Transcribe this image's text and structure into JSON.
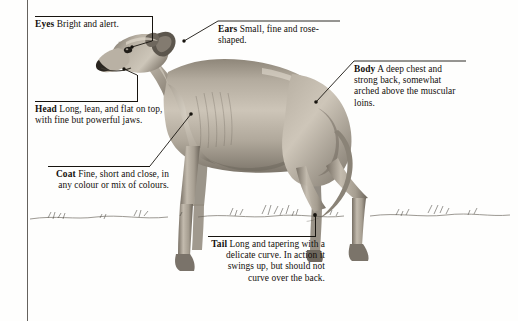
{
  "figure": {
    "ground_line": "sketched grass horizon",
    "colors": {
      "ink": "#17140f",
      "paper": "#fefefd",
      "coat_light": "#cfc7ba",
      "coat_mid": "#a39a8d",
      "coat_dark": "#6d665c",
      "coat_shadow": "#4a443c"
    }
  },
  "callouts": [
    {
      "id": "eyes",
      "term": "Eyes",
      "text": " Bright and alert."
    },
    {
      "id": "head",
      "term": "Head",
      "text": " Long, lean, and flat on top, with fine but powerful jaws."
    },
    {
      "id": "coat",
      "term": "Coat",
      "text": " Fine, short and close, in any colour or mix of colours."
    },
    {
      "id": "ears",
      "term": "Ears",
      "text": " Small, fine and rose-shaped."
    },
    {
      "id": "body",
      "term": "Body",
      "text": " A deep chest and strong back, somewhat arched above the muscular loins."
    },
    {
      "id": "tail",
      "term": "Tail",
      "text": " Long and tapering with a delicate curve. In action it swings up, but should not curve over the back."
    }
  ]
}
